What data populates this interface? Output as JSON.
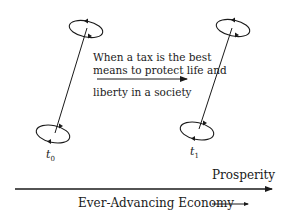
{
  "diagram": {
    "caption_lines": [
      "When a tax is the best",
      "means to protect life and",
      "liberty in a society"
    ],
    "time_labels": [
      {
        "base": "t",
        "sub": "0"
      },
      {
        "base": "t",
        "sub": "1"
      }
    ],
    "axis": {
      "top_label": "Prosperity",
      "bottom_label": "Ever-Advancing Economy"
    },
    "colors": {
      "ink": "#1a1a1a",
      "background": "#ffffff"
    }
  }
}
